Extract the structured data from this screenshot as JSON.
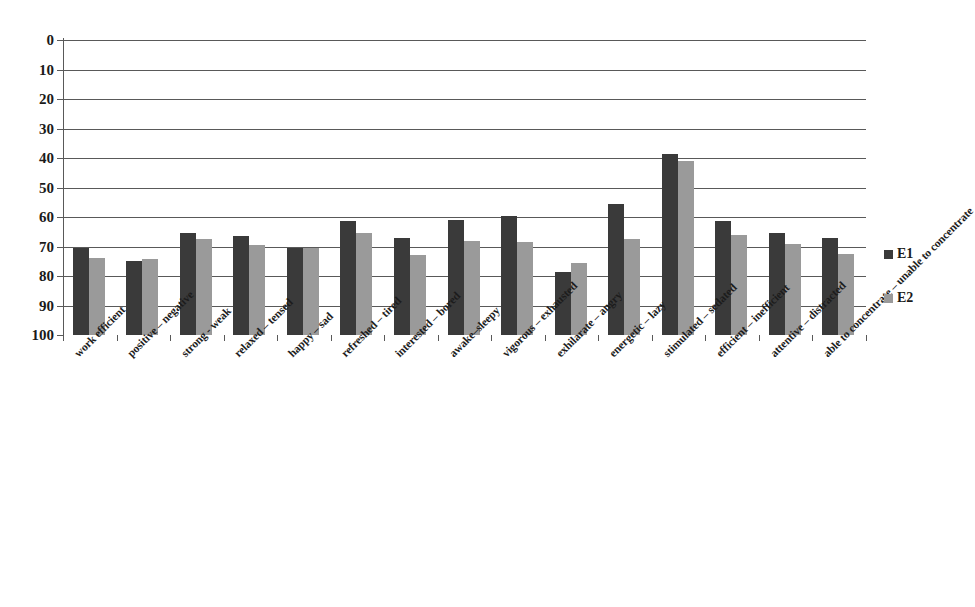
{
  "chart_data": {
    "type": "bar",
    "title": "",
    "subtitle": "",
    "xlabel": "",
    "ylabel": "",
    "ylim": [
      0,
      100
    ],
    "yticks": [
      0,
      10,
      20,
      30,
      40,
      50,
      60,
      70,
      80,
      90,
      100
    ],
    "grid": true,
    "legend_position": "right",
    "categories": [
      "work efficient",
      "positive – negative",
      "strong - weak",
      "relaxed – tensed",
      "happy – sad",
      "refreshed – tired",
      "interested – bored",
      "awake–sleepy",
      "vigorous – exhausted",
      "exhilarate – angry",
      "energetic – lazy",
      "stimulated – sedated",
      "efficient – inefficient",
      "attentive – distracted",
      "able to concentrate – unable to concentrate"
    ],
    "series": [
      {
        "name": "E1",
        "color": "#3a3a3a",
        "values": [
          29.5,
          25.0,
          34.5,
          33.5,
          29.5,
          38.5,
          33.0,
          39.0,
          40.5,
          21.5,
          44.5,
          61.5,
          38.5,
          34.5,
          33.0
        ]
      },
      {
        "name": "E2",
        "color": "#9a9a9a",
        "values": [
          26.0,
          25.8,
          32.5,
          30.5,
          29.5,
          34.5,
          27.0,
          32.0,
          31.5,
          24.5,
          32.5,
          59.0,
          34.0,
          31.0,
          27.5
        ]
      }
    ]
  },
  "axis": {
    "y_tick_labels": [
      "100",
      "90",
      "80",
      "70",
      "60",
      "50",
      "40",
      "30",
      "20",
      "10",
      "0"
    ]
  },
  "legend": {
    "items": [
      {
        "label": "E1",
        "color": "#3a3a3a"
      },
      {
        "label": "E2",
        "color": "#9a9a9a"
      }
    ]
  }
}
